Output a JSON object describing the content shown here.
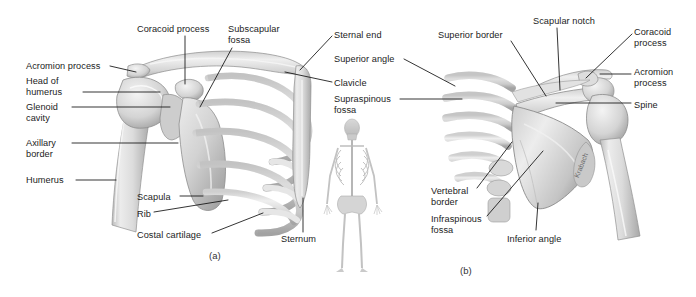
{
  "figure": {
    "background_color": "#ffffff",
    "line_color": "#111111",
    "text_color": "#1c1c1c",
    "bone_light": "#f2f2f2",
    "bone_mid": "#d8d8d8",
    "bone_shadow": "#a9a9a9",
    "artist_signature": "Krabach"
  },
  "panels": [
    {
      "id": "a",
      "caption": "(a)",
      "view": "anterior-shoulder-girdle"
    },
    {
      "id": "b",
      "caption": "(b)",
      "view": "posterior-shoulder-girdle"
    }
  ],
  "center_inset": {
    "name": "whole-body-skeleton-orientation-figure",
    "view": "anterior full skeleton"
  },
  "labels_left_panel": [
    {
      "id": "coracoid-process-a",
      "text": "Coracoid process",
      "x": 137,
      "y": 24,
      "align": "left",
      "leader": [
        [
          185,
          36
        ],
        [
          185,
          84
        ]
      ]
    },
    {
      "id": "subscapular-fossa-a",
      "text": "Subscapular\nfossa",
      "x": 228,
      "y": 24,
      "align": "left",
      "leader": [
        [
          232,
          48
        ],
        [
          200,
          107
        ]
      ]
    },
    {
      "id": "sternal-end-a",
      "text": "Sternal end",
      "x": 334,
      "y": 30,
      "align": "left",
      "leader": [
        [
          332,
          36
        ],
        [
          300,
          70
        ]
      ]
    },
    {
      "id": "acromion-process-a",
      "text": "Acromion process",
      "x": 26,
      "y": 61,
      "align": "left",
      "leader": [
        [
          110,
          66
        ],
        [
          136,
          72
        ]
      ]
    },
    {
      "id": "superior-angle-a",
      "text": "Superior angle",
      "x": 334,
      "y": 54,
      "align": "left",
      "leader": [
        [
          404,
          59
        ],
        [
          455,
          86
        ]
      ]
    },
    {
      "id": "head-of-humerus-a",
      "text": "Head of\nhumerus",
      "x": 26,
      "y": 76,
      "align": "left",
      "leader": [
        [
          83,
          92
        ],
        [
          160,
          92
        ]
      ]
    },
    {
      "id": "clavicle-a",
      "text": "Clavicle",
      "x": 334,
      "y": 78,
      "align": "left",
      "leader": [
        [
          332,
          82
        ],
        [
          285,
          72
        ]
      ]
    },
    {
      "id": "glenoid-cavity-a",
      "text": "Glenoid\ncavity",
      "x": 26,
      "y": 102,
      "align": "left",
      "leader": [
        [
          72,
          107
        ],
        [
          170,
          107
        ]
      ]
    },
    {
      "id": "supraspinous-fossa-a",
      "text": "Supraspinous\nfossa",
      "x": 334,
      "y": 94,
      "align": "left",
      "leader": [
        [
          400,
          99
        ],
        [
          462,
          99
        ]
      ]
    },
    {
      "id": "axillary-border-a",
      "text": "Axillary\nborder",
      "x": 26,
      "y": 138,
      "align": "left",
      "leader": [
        [
          72,
          143
        ],
        [
          178,
          143
        ]
      ]
    },
    {
      "id": "humerus-a",
      "text": "Humerus",
      "x": 26,
      "y": 175,
      "align": "left",
      "leader": [
        [
          76,
          180
        ],
        [
          116,
          180
        ]
      ]
    },
    {
      "id": "scapula-a",
      "text": "Scapula",
      "x": 137,
      "y": 192,
      "align": "left",
      "leader": [
        [
          180,
          196
        ],
        [
          203,
          196
        ]
      ]
    },
    {
      "id": "rib-a",
      "text": "Rib",
      "x": 137,
      "y": 209,
      "align": "left",
      "leader": [
        [
          154,
          212
        ],
        [
          228,
          200
        ]
      ]
    },
    {
      "id": "costal-cartilage-a",
      "text": "Costal cartilage",
      "x": 137,
      "y": 230,
      "align": "left",
      "leader": [
        [
          212,
          233
        ],
        [
          263,
          213
        ]
      ]
    },
    {
      "id": "sternum-a",
      "text": "Sternum",
      "x": 281,
      "y": 234,
      "align": "left",
      "leader": [
        [
          303,
          232
        ],
        [
          303,
          198
        ]
      ]
    }
  ],
  "labels_right_panel": [
    {
      "id": "superior-border-b",
      "text": "Superior border",
      "x": 438,
      "y": 30,
      "align": "left",
      "leader": [
        [
          511,
          41
        ],
        [
          546,
          96
        ]
      ]
    },
    {
      "id": "scapular-notch-b",
      "text": "Scapular notch",
      "x": 533,
      "y": 16,
      "align": "left",
      "leader": [
        [
          557,
          28
        ],
        [
          560,
          90
        ]
      ]
    },
    {
      "id": "coracoid-process-b",
      "text": "Coracoid\nprocess",
      "x": 634,
      "y": 27,
      "align": "left",
      "leader": [
        [
          632,
          34
        ],
        [
          586,
          78
        ]
      ]
    },
    {
      "id": "acromion-process-b",
      "text": "Acromion\nprocess",
      "x": 634,
      "y": 67,
      "align": "left",
      "leader": [
        [
          631,
          74
        ],
        [
          600,
          74
        ]
      ]
    },
    {
      "id": "spine-b",
      "text": "Spine",
      "x": 634,
      "y": 100,
      "align": "left",
      "leader": [
        [
          631,
          103
        ],
        [
          556,
          103
        ]
      ]
    },
    {
      "id": "vertebral-border-b",
      "text": "Vertebral\nborder",
      "x": 431,
      "y": 186,
      "align": "left",
      "leader": [
        [
          477,
          188
        ],
        [
          512,
          142
        ]
      ]
    },
    {
      "id": "infraspinous-fossa-b",
      "text": "Infraspinous\nfossa",
      "x": 431,
      "y": 214,
      "align": "left",
      "leader": [
        [
          487,
          216
        ],
        [
          543,
          151
        ]
      ]
    },
    {
      "id": "inferior-angle-b",
      "text": "Inferior angle",
      "x": 507,
      "y": 234,
      "align": "left",
      "leader": [
        [
          536,
          230
        ],
        [
          538,
          203
        ]
      ]
    }
  ]
}
